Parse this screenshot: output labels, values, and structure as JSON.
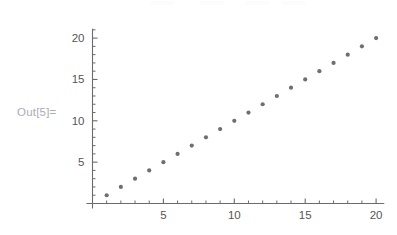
{
  "cell": {
    "out_label": "Out[5]=",
    "out_label_color": "#a9acb3"
  },
  "style": {
    "background": "#ffffff",
    "axis_color": "#6b6b6b",
    "tick_label_color": "#555555",
    "point_color": "#6f6f6f"
  },
  "chart_data": {
    "type": "scatter",
    "title": "",
    "xlabel": "",
    "ylabel": "",
    "xlim": [
      0,
      21
    ],
    "ylim": [
      0,
      21.5
    ],
    "grid": false,
    "legend": null,
    "x": [
      1,
      2,
      3,
      4,
      5,
      6,
      7,
      8,
      9,
      10,
      11,
      12,
      13,
      14,
      15,
      16,
      17,
      18,
      19,
      20
    ],
    "series": [
      {
        "name": "points",
        "values": [
          1,
          2,
          3,
          4,
          5,
          6,
          7,
          8,
          9,
          10,
          11,
          12,
          13,
          14,
          15,
          16,
          17,
          18,
          19,
          20
        ]
      }
    ],
    "xticks": [
      5,
      10,
      15,
      20
    ],
    "xtick_labels": [
      "5",
      "10",
      "15",
      "20"
    ],
    "yticks": [
      5,
      10,
      15,
      20
    ],
    "ytick_labels": [
      "5",
      "10",
      "15",
      "20"
    ],
    "x_minor_ticks": [
      1,
      2,
      3,
      4,
      6,
      7,
      8,
      9,
      11,
      12,
      13,
      14,
      16,
      17,
      18,
      19
    ],
    "y_minor_ticks": [
      1,
      2,
      3,
      4,
      6,
      7,
      8,
      9,
      11,
      12,
      13,
      14,
      16,
      17,
      18,
      19,
      21
    ],
    "point_marker": "circle",
    "point_size": 3
  }
}
